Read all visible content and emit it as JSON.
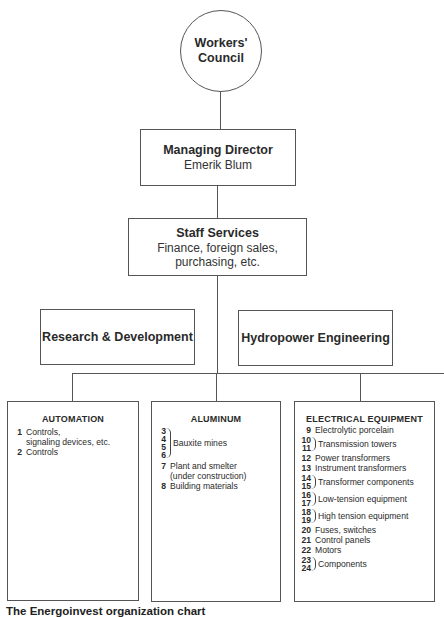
{
  "council": {
    "title": "Workers' Council"
  },
  "director": {
    "title": "Managing Director",
    "name": "Emerik Blum"
  },
  "staff": {
    "title": "Staff Services",
    "line1": "Finance, foreign sales,",
    "line2": "purchasing, etc."
  },
  "research": {
    "title": "Research & Development"
  },
  "hydro": {
    "title": "Hydropower Engineering"
  },
  "divisions": [
    {
      "title": "AUTOMATION",
      "items": [
        {
          "num": "1",
          "label": "Controls,",
          "label2": "signaling devices, etc."
        },
        {
          "num": "2",
          "label": "Controls"
        }
      ]
    },
    {
      "title": "ALUMINUM",
      "groups": [
        {
          "nums": [
            "3",
            "4",
            "5",
            "6"
          ],
          "label": "Bauxite mines"
        }
      ],
      "items": [
        {
          "num": "7",
          "label": "Plant and smelter",
          "label2": "(under construction)"
        },
        {
          "num": "8",
          "label": "Building materials"
        }
      ]
    },
    {
      "title": "ELECTRICAL EQUIPMENT",
      "entries": [
        {
          "nums": [
            "9"
          ],
          "label": "Electrolytic porcelain"
        },
        {
          "nums": [
            "10",
            "11"
          ],
          "label": "Transmission towers"
        },
        {
          "nums": [
            "12"
          ],
          "label": "Power transformers"
        },
        {
          "nums": [
            "13"
          ],
          "label": "Instrument transformers"
        },
        {
          "nums": [
            "14",
            "15"
          ],
          "label": "Transformer components"
        },
        {
          "nums": [
            "16",
            "17"
          ],
          "label": "Low-tension equipment"
        },
        {
          "nums": [
            "18",
            "19"
          ],
          "label": "High tension equipment"
        },
        {
          "nums": [
            "20"
          ],
          "label": "Fuses, switches"
        },
        {
          "nums": [
            "21"
          ],
          "label": "Control panels"
        },
        {
          "nums": [
            "22"
          ],
          "label": "Motors"
        },
        {
          "nums": [
            "23",
            "24"
          ],
          "label": "Components"
        }
      ]
    }
  ],
  "caption": "The Energoinvest organization chart"
}
